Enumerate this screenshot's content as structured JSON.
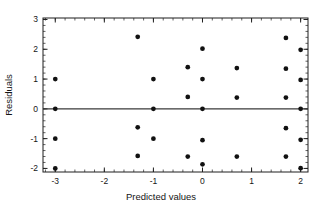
{
  "chart_data": {
    "type": "scatter",
    "title": "",
    "xlabel": "Predicted values",
    "ylabel": "Residuals",
    "xlim": [
      -3.25,
      2.15
    ],
    "ylim": [
      -2.12,
      3.05
    ],
    "xticks": [
      -3,
      -2,
      -1,
      0,
      1,
      2
    ],
    "xtick_labels": [
      "-3",
      "-2",
      "-1",
      "0",
      "1",
      "2"
    ],
    "yticks": [
      -2,
      -1,
      0,
      1,
      2,
      3
    ],
    "ytick_labels": [
      "-2",
      "-1",
      "0",
      "1",
      "2",
      "3"
    ],
    "x_minor_tick_step": 0.2,
    "y_minor_tick_step": 0.2,
    "grid": false,
    "legend": null,
    "reference_line": {
      "type": "horizontal",
      "y": 0,
      "color": "#3a3a3a"
    },
    "marker": {
      "shape": "circle",
      "color": "#111111",
      "size": 3.2
    },
    "points": [
      {
        "x": -3.0,
        "y": 1.0
      },
      {
        "x": -3.0,
        "y": 0.0
      },
      {
        "x": -3.0,
        "y": -1.0
      },
      {
        "x": -3.0,
        "y": -2.0
      },
      {
        "x": -1.32,
        "y": 2.42
      },
      {
        "x": -1.32,
        "y": -0.62
      },
      {
        "x": -1.32,
        "y": -1.58
      },
      {
        "x": -1.0,
        "y": 1.0
      },
      {
        "x": -1.0,
        "y": 0.0
      },
      {
        "x": -1.0,
        "y": -1.0
      },
      {
        "x": -0.3,
        "y": 1.4
      },
      {
        "x": -0.3,
        "y": 0.4
      },
      {
        "x": -0.3,
        "y": -1.6
      },
      {
        "x": 0.0,
        "y": 2.02
      },
      {
        "x": 0.0,
        "y": 1.0
      },
      {
        "x": 0.0,
        "y": 0.0
      },
      {
        "x": 0.0,
        "y": -1.05
      },
      {
        "x": 0.0,
        "y": -1.86
      },
      {
        "x": 0.7,
        "y": 1.37
      },
      {
        "x": 0.7,
        "y": 0.38
      },
      {
        "x": 0.7,
        "y": -1.6
      },
      {
        "x": 1.7,
        "y": 2.38
      },
      {
        "x": 1.7,
        "y": 1.35
      },
      {
        "x": 1.7,
        "y": 0.38
      },
      {
        "x": 1.7,
        "y": -0.65
      },
      {
        "x": 1.7,
        "y": -1.6
      },
      {
        "x": 2.0,
        "y": 1.98
      },
      {
        "x": 2.0,
        "y": 0.97
      },
      {
        "x": 2.0,
        "y": 0.0
      },
      {
        "x": 2.0,
        "y": -1.04
      },
      {
        "x": 2.0,
        "y": -1.99
      }
    ]
  }
}
